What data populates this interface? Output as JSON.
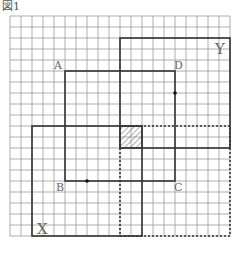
{
  "figure": {
    "title": "図1",
    "grid": {
      "origin_px": [
        10,
        16
      ],
      "cell_px": 11,
      "cols": 20,
      "rows": 20,
      "line_color": "#9a9a9a"
    },
    "square_abcd": {
      "corners": {
        "A": [
          5,
          5
        ],
        "D": [
          15,
          5
        ],
        "C": [
          15,
          15
        ],
        "B": [
          5,
          15
        ]
      },
      "labels": {
        "A": "A",
        "B": "B",
        "C": "C",
        "D": "D"
      },
      "dots": [
        [
          15,
          7
        ],
        [
          7,
          15
        ]
      ]
    },
    "square_x": {
      "label": "X",
      "x": 2,
      "y": 10,
      "w": 10,
      "h": 10
    },
    "square_y": {
      "label": "Y",
      "x": 10,
      "y": 2,
      "w": 10,
      "h": 10
    },
    "dotted_square": {
      "x": 10,
      "y": 10,
      "w": 10,
      "h": 10
    },
    "hatched_region": {
      "x": 10,
      "y": 10,
      "w": 2,
      "h": 2
    },
    "colors": {
      "outline": "#333333",
      "label": "#666666",
      "hatch": "#777777"
    }
  }
}
